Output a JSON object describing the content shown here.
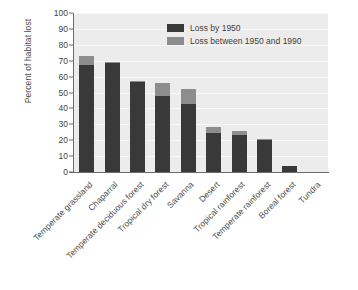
{
  "chart_data": {
    "type": "bar",
    "stacked": true,
    "title": "",
    "xlabel": "",
    "ylabel": "Percent of habitat lost",
    "ylim": [
      0,
      100
    ],
    "ytick_step": 10,
    "yticks": [
      "100",
      "90",
      "80",
      "70",
      "60",
      "50",
      "40",
      "30",
      "20",
      "10",
      "0"
    ],
    "grid": "horizontal",
    "legend_position": "top-right",
    "categories": [
      "Temperate grassland",
      "Chaparral",
      "Temperate deciduous forest",
      "Tropical dry forest",
      "Savanna",
      "Desert",
      "Tropical rainforest",
      "Temperate rainforest",
      "Boreal forest",
      "Tundra"
    ],
    "series": [
      {
        "name": "Loss by 1950",
        "color": "#393939",
        "values": [
          67,
          68.5,
          57,
          48,
          43,
          24.5,
          23,
          20,
          3.5,
          0
        ]
      },
      {
        "name": "Loss between 1950 and 1990",
        "color": "#8d8d8d",
        "values": [
          6,
          0.8,
          0.5,
          8,
          9,
          3.5,
          2.5,
          0.5,
          0,
          0
        ]
      }
    ]
  },
  "legend": {
    "items": [
      {
        "label": "Loss by 1950",
        "color": "#393939"
      },
      {
        "label": "Loss between 1950 and 1990",
        "color": "#8d8d8d"
      }
    ]
  },
  "axes": {
    "y_title": "Percent of habitat lost"
  },
  "colors": {
    "plot_background": "#ececec",
    "gridline": "#f7f7f7",
    "axis": "#6b6b6b",
    "page_background": "#ffffff",
    "series_dark": "#393939",
    "series_gray": "#8d8d8d"
  }
}
